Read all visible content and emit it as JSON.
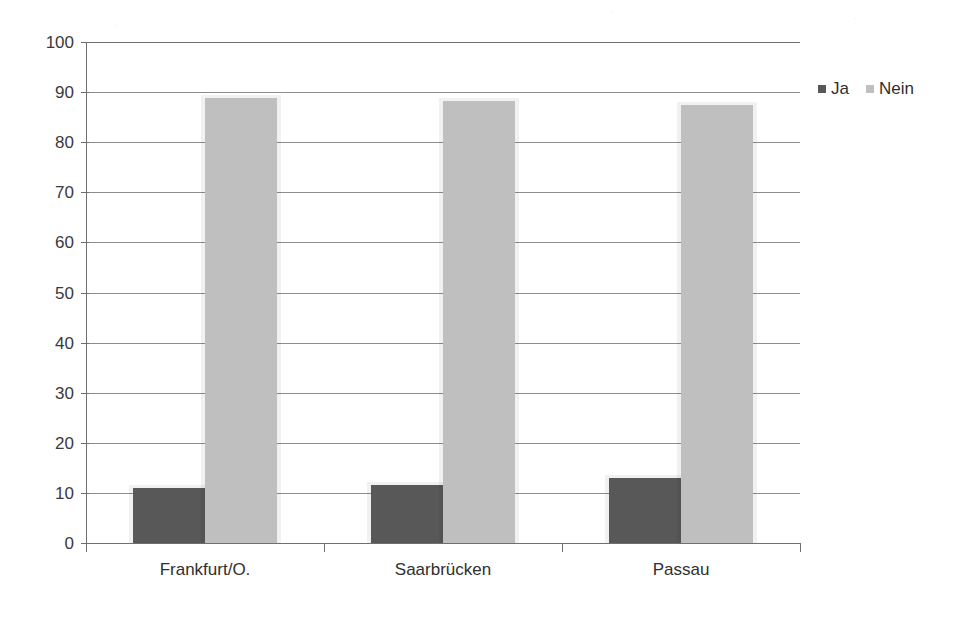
{
  "chart_data": {
    "type": "bar",
    "title": "",
    "xlabel": "",
    "ylabel": "",
    "ylim": [
      0,
      100
    ],
    "ytick_step": 10,
    "yticks": [
      100,
      90,
      80,
      70,
      60,
      50,
      40,
      30,
      20,
      10,
      0
    ],
    "grid": true,
    "legend_position": "right",
    "categories": [
      "Frankfurt/O.",
      "Saarbrücken",
      "Passau"
    ],
    "series": [
      {
        "name": "Ja",
        "color": "#585858",
        "values": [
          11.0,
          11.5,
          13.0
        ]
      },
      {
        "name": "Nein",
        "color": "#bfbfbf",
        "values": [
          88.8,
          88.3,
          87.5
        ]
      }
    ]
  },
  "legend": {
    "items": [
      {
        "label": "Ja",
        "swatch": "ja"
      },
      {
        "label": "Nein",
        "swatch": "nein"
      }
    ]
  },
  "colors": {
    "ja": "#585858",
    "nein": "#bfbfbf",
    "axis": "#6f6f6f",
    "grid": "#8d8d8d",
    "background": "#ffffff"
  }
}
